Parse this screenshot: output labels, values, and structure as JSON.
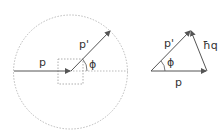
{
  "left_diagram": {
    "labels": {
      "p": "p",
      "p_prime": "p'",
      "phi": "ϕ"
    }
  },
  "right_diagram": {
    "labels": {
      "p": "p",
      "p_prime": "p'",
      "phi": "ϕ",
      "hq": "ħq"
    }
  },
  "colors": {
    "line": "#555555",
    "dotted": "#aaaaaa",
    "text": "#333333"
  }
}
